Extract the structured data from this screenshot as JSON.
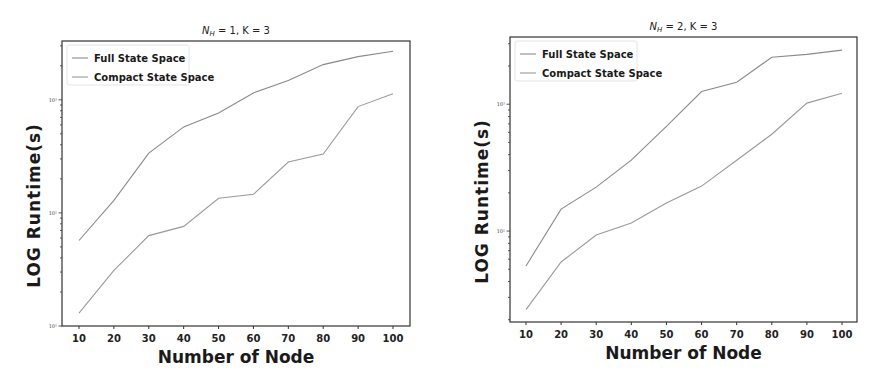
{
  "chart_data": [
    {
      "type": "line",
      "title": "N_H = 1, K = 3",
      "title_main": "N",
      "title_sub": "H",
      "title_rest": " = 1, K = 3",
      "xlabel": "Number of Node",
      "ylabel": "LOG Runtime(s)",
      "yscale": "log",
      "x": [
        10,
        20,
        30,
        40,
        50,
        60,
        70,
        80,
        90,
        100
      ],
      "xticks": [
        "10",
        "20",
        "30",
        "40",
        "50",
        "60",
        "70",
        "80",
        "90",
        "100"
      ],
      "yticks": [
        {
          "value": 10,
          "label": "10¹"
        },
        {
          "value": 100,
          "label": "10²"
        },
        {
          "value": 1000,
          "label": "10³"
        }
      ],
      "ylim_log10": [
        1.0,
        3.52
      ],
      "legend_position": "upper left",
      "grid": false,
      "series": [
        {
          "name": "Full State Space",
          "color": "#8a8a8a",
          "values": [
            57,
            129,
            338,
            576,
            763,
            1150,
            1480,
            2050,
            2410,
            2690
          ]
        },
        {
          "name": "Compact State Space",
          "color": "#9a9a9a",
          "values": [
            13,
            31,
            63,
            76,
            135,
            146,
            282,
            332,
            870,
            1130
          ]
        }
      ]
    },
    {
      "type": "line",
      "title": "N_H = 2, K = 3",
      "title_main": "N",
      "title_sub": "H",
      "title_rest": " = 2, K = 3",
      "xlabel": "Number of Node",
      "ylabel": "LOG Runtime(s)",
      "yscale": "log",
      "x": [
        10,
        20,
        30,
        40,
        50,
        60,
        70,
        80,
        90,
        100
      ],
      "xticks": [
        "10",
        "20",
        "30",
        "40",
        "50",
        "60",
        "70",
        "80",
        "90",
        "100"
      ],
      "yticks": [
        {
          "value": 100,
          "label": "10²"
        },
        {
          "value": 1000,
          "label": "10³"
        }
      ],
      "ylim_log10": [
        1.283,
        3.53
      ],
      "legend_position": "upper left",
      "grid": false,
      "series": [
        {
          "name": "Full State Space",
          "color": "#8a8a8a",
          "values": [
            53,
            149,
            222,
            362,
            670,
            1260,
            1490,
            2350,
            2470,
            2670
          ]
        },
        {
          "name": "Compact State Space",
          "color": "#9a9a9a",
          "values": [
            24,
            57,
            93,
            116,
            166,
            226,
            362,
            580,
            1020,
            1220
          ]
        }
      ]
    }
  ]
}
